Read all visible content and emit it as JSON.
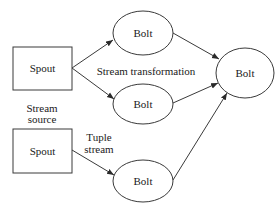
{
  "diagram": {
    "nodes": {
      "spout_top": {
        "label": "Spout",
        "type": "rectangle"
      },
      "spout_bottom": {
        "label": "Spout",
        "type": "rectangle"
      },
      "bolt_top": {
        "label": "Bolt",
        "type": "ellipse"
      },
      "bolt_middle": {
        "label": "Bolt",
        "type": "ellipse"
      },
      "bolt_bottom": {
        "label": "Bolt",
        "type": "ellipse"
      },
      "bolt_right": {
        "label": "Bolt",
        "type": "ellipse"
      }
    },
    "annotations": {
      "stream_transformation": "Stream transformation",
      "stream_source_line1": "Stream",
      "stream_source_line2": "source",
      "tuple_stream_line1": "Tuple",
      "tuple_stream_line2": "stream"
    },
    "edges": [
      {
        "from": "spout_top",
        "to": "bolt_top"
      },
      {
        "from": "spout_top",
        "to": "bolt_middle"
      },
      {
        "from": "spout_bottom",
        "to": "bolt_bottom"
      },
      {
        "from": "bolt_top",
        "to": "bolt_right"
      },
      {
        "from": "bolt_middle",
        "to": "bolt_right"
      },
      {
        "from": "bolt_bottom",
        "to": "bolt_right"
      }
    ]
  }
}
